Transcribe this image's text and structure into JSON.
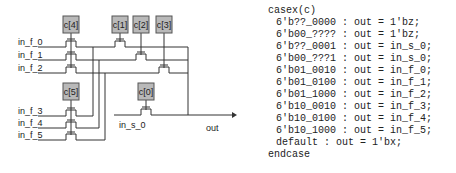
{
  "diagram": {
    "control_boxes": [
      {
        "label": "c[4]",
        "x": 63,
        "y": 16
      },
      {
        "label": "c[1]",
        "x": 112,
        "y": 16
      },
      {
        "label": "c[2]",
        "x": 133,
        "y": 16
      },
      {
        "label": "c[3]",
        "x": 156,
        "y": 16
      },
      {
        "label": "c[5]",
        "x": 63,
        "y": 83
      },
      {
        "label": "c[0]",
        "x": 138,
        "y": 83
      }
    ],
    "inputs": [
      {
        "label": "in_f_0",
        "y": 47
      },
      {
        "label": "in_f_1",
        "y": 60
      },
      {
        "label": "in_f_2",
        "y": 73
      },
      {
        "label": "in_f_3",
        "y": 116
      },
      {
        "label": "in_f_4",
        "y": 128
      },
      {
        "label": "in_f_5",
        "y": 140
      }
    ],
    "select_input": {
      "label": "in_s_0"
    },
    "output": {
      "label": "out"
    },
    "colors": {
      "wire": "#333333",
      "box_fill": "#b9b9b9",
      "box_stroke": "#555555"
    }
  },
  "code": {
    "header": "casex(c)",
    "cases": [
      "6'b??_0000 : out = 1'bz;",
      "6'b00_???? : out = 1'bz;",
      "6'b??_0001 : out = in_s_0;",
      "6'b00_???1 : out = in_s_0;",
      "6'b01_0010 : out = in_f_0;",
      "6'b01_0100 : out = in_f_1;",
      "6'b01_1000 : out = in_f_2;",
      "6'b10_0010 : out = in_f_3;",
      "6'b10_0100 : out = in_f_4;",
      "6'b10_1000 : out = in_f_5;"
    ],
    "default": "default : out = 1'bx;",
    "footer": "endcase"
  }
}
